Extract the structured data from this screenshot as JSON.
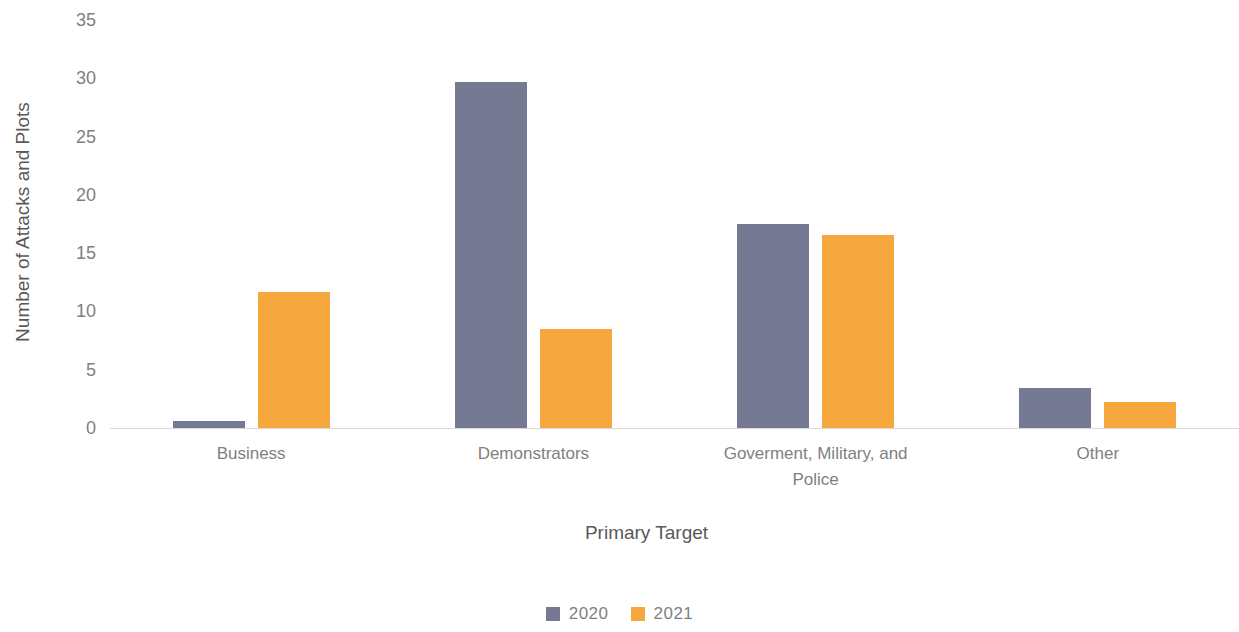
{
  "chart_data": {
    "type": "bar",
    "title": "",
    "xlabel": "Primary Target",
    "ylabel": "Number of Attacks and Plots",
    "categories": [
      "Business",
      "Demonstrators",
      "Goverment, Military, and\nPolice",
      "Other"
    ],
    "series": [
      {
        "name": "2020",
        "color": "#757992",
        "values": [
          0.6,
          29.7,
          17.5,
          3.4
        ]
      },
      {
        "name": "2021",
        "color": "#f6a83e",
        "values": [
          11.7,
          8.5,
          16.6,
          2.2
        ]
      }
    ],
    "ylim": [
      0,
      35
    ],
    "y_ticks": [
      0,
      5,
      10,
      15,
      20,
      25,
      30,
      35
    ],
    "grid": false,
    "legend_position": "bottom",
    "axis_line_color": "#d9d9d9"
  }
}
